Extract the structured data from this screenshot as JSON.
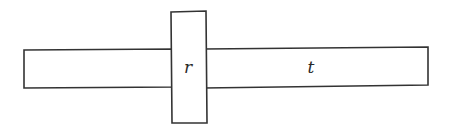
{
  "diagram": {
    "background": "#ffffff",
    "stroke_color": "#333333",
    "bars": [
      {
        "id": "left-bar",
        "label": "",
        "x": 24,
        "y": 49,
        "width": 150,
        "height": 39
      },
      {
        "id": "right-bar",
        "label": "t",
        "x": 204,
        "y": 47,
        "width": 224,
        "height": 39
      }
    ],
    "block": {
      "id": "center-block",
      "label": "r",
      "x": 170,
      "y": 11,
      "width": 37,
      "height": 112
    },
    "labels": {
      "r": "r",
      "t": "t"
    }
  }
}
